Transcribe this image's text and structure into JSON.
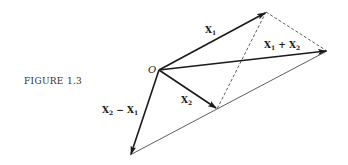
{
  "figure": {
    "caption": "FIGURE 1.3",
    "origin_label": "O",
    "vectors": [
      {
        "id": "x1",
        "base": "X",
        "sub": "1",
        "suffix": "",
        "style": "arrow"
      },
      {
        "id": "x2",
        "base": "X",
        "sub": "2",
        "suffix": "",
        "style": "arrow"
      },
      {
        "id": "sum",
        "base": "X",
        "sub": "1",
        "op": " + ",
        "base2": "X",
        "sub2": "2",
        "style": "arrow"
      },
      {
        "id": "diff",
        "base": "X",
        "sub": "2",
        "op": " − ",
        "base2": "X",
        "sub2": "1",
        "style": "arrow"
      }
    ],
    "construction_lines": [
      {
        "id": "x1-to-sum",
        "style": "dashed"
      },
      {
        "id": "x1-to-x2",
        "style": "dashed"
      },
      {
        "id": "x2-to-sum",
        "style": "solid"
      },
      {
        "id": "diff-to-x2",
        "style": "solid"
      }
    ]
  }
}
